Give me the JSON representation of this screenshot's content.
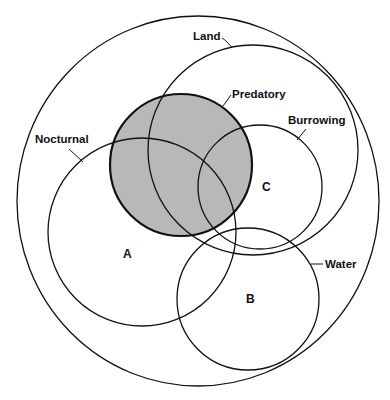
{
  "diagram": {
    "type": "venn",
    "universe": {
      "cx": 198,
      "cy": 201,
      "rx": 181,
      "ry": 185
    },
    "sets": [
      {
        "id": "land",
        "label": "Land",
        "cx": 253,
        "cy": 150,
        "r": 105,
        "shaded": false
      },
      {
        "id": "burrowing",
        "label": "Burrowing",
        "cx": 260,
        "cy": 187,
        "r": 62,
        "shaded": false
      },
      {
        "id": "nocturnal",
        "label": "Nocturnal",
        "cx": 142,
        "cy": 232,
        "r": 94,
        "shaded": false
      },
      {
        "id": "water",
        "label": "Water",
        "cx": 248,
        "cy": 299,
        "r": 71,
        "shaded": false
      },
      {
        "id": "predatory",
        "label": "Predatory",
        "cx": 181,
        "cy": 165,
        "r": 71,
        "shaded": true
      }
    ],
    "regions": [
      {
        "label": "A",
        "x": 127,
        "y": 258
      },
      {
        "label": "B",
        "x": 250,
        "y": 303
      },
      {
        "label": "C",
        "x": 266,
        "y": 191
      }
    ],
    "colors": {
      "stroke": "#111111",
      "shade": "#b8b8b8",
      "background": "#ffffff"
    }
  }
}
